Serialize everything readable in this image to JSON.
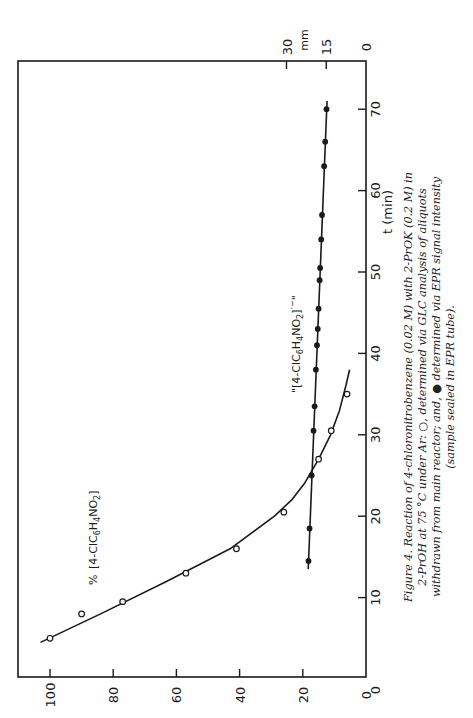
{
  "figure": {
    "orientation": "rotated 90 degrees counter-clockwise",
    "caption": {
      "lines": [
        "Figure 4. Reaction of 4-chloronitrobenzene (0.02 M) with 2-PrOK (0.2 M) in",
        "2-PrOH at 75 °C under Ar: ○, determined via GLC analysis of aliquots",
        "withdrawn from main reactor; and, ● determined via EPR signal intensity",
        "(sample sealed in EPR tube)."
      ]
    },
    "annotations": {
      "open_series_label_prefix": "%",
      "open_series_label": "[4-ClC6H4NO2]",
      "filled_series_label": "\"[4-ClC6H4NO2]·−\""
    },
    "axis_titles": {
      "x": "t (min)",
      "y_left": "%",
      "y_right": "mm"
    }
  },
  "chart_data": {
    "type": "line",
    "xlabel": "t (min)",
    "ylabel": "% [4-ClC6H4NO2]",
    "y2label": "mm (EPR signal intensity)",
    "xlim": [
      0,
      70
    ],
    "ylim": [
      0,
      100
    ],
    "y2lim": [
      0,
      30
    ],
    "x_ticks": [
      10,
      20,
      30,
      40,
      50,
      60,
      70
    ],
    "y_ticks": [
      0,
      20,
      40,
      60,
      80,
      100
    ],
    "y2_ticks": [
      0,
      15,
      30
    ],
    "grid": false,
    "series": [
      {
        "name": "% [4-ClC6H4NO2] (GLC, open circles)",
        "marker": "open-circle",
        "axis": "left",
        "x": [
          5,
          8,
          9.5,
          13,
          16,
          20.5,
          27,
          30.5,
          35
        ],
        "y": [
          100,
          90,
          77,
          57,
          41,
          26,
          15,
          11,
          6
        ],
        "fit_curve": {
          "x": [
            4.5,
            8,
            12,
            16,
            20,
            22,
            24,
            27,
            30,
            33,
            36,
            38
          ],
          "y": [
            103,
            84,
            63,
            43,
            29,
            23.5,
            19.5,
            15,
            11.2,
            8.4,
            6.4,
            5.2
          ]
        }
      },
      {
        "name": "\"[4-ClC6H4NO2]·−\" (EPR, filled circles)",
        "marker": "filled-circle",
        "axis": "right",
        "x": [
          14.5,
          18.5,
          25,
          30.5,
          33.5,
          38,
          41,
          43,
          45.5,
          49,
          50.5,
          54,
          57,
          63,
          66,
          70
        ],
        "y": [
          21.7,
          21.3,
          20.5,
          19.8,
          19.4,
          18.9,
          18.5,
          18.2,
          17.9,
          17.5,
          17.3,
          16.9,
          16.6,
          15.8,
          15.4,
          14.9
        ],
        "fit_line": {
          "x": [
            13.5,
            71
          ],
          "y": [
            21.8,
            14.7
          ]
        }
      }
    ]
  }
}
